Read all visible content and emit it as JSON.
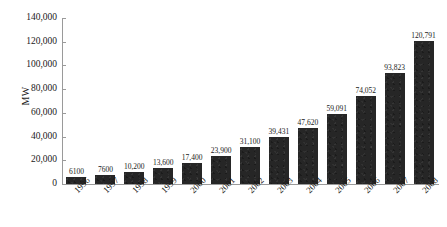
{
  "chart_data": {
    "type": "bar",
    "title": "",
    "subtitle": "",
    "xlabel": "",
    "ylabel": "MW",
    "categories": [
      "1996",
      "1997",
      "1998",
      "1999",
      "2000",
      "2001",
      "2002",
      "2003",
      "2004",
      "2005",
      "2006",
      "2007",
      "2008"
    ],
    "values": [
      6100,
      7600,
      10200,
      13600,
      17400,
      23900,
      31100,
      39431,
      47620,
      59091,
      74052,
      93823,
      120791
    ],
    "value_labels": [
      "6100",
      "7600",
      "10,200",
      "13,600",
      "17,400",
      "23,900",
      "31,100",
      "39,431",
      "47,620",
      "59,091",
      "74,052",
      "93,823",
      "120,791"
    ],
    "ylim": [
      0,
      140000
    ],
    "ytick_values": [
      0,
      20000,
      40000,
      60000,
      80000,
      100000,
      120000,
      140000
    ],
    "ytick_labels": [
      "0",
      "20,000",
      "40,000",
      "60,000",
      "80,000",
      "100,000",
      "120,000",
      "140,000"
    ],
    "grid": false,
    "legend": null,
    "legend_position": "none",
    "bar_color": "#262626",
    "axis_color": "#9a9a9a",
    "text_color": "#1a1a1a",
    "background_color": "#ffffff",
    "xtick_rotation": -45,
    "data_labels_shown": true
  }
}
